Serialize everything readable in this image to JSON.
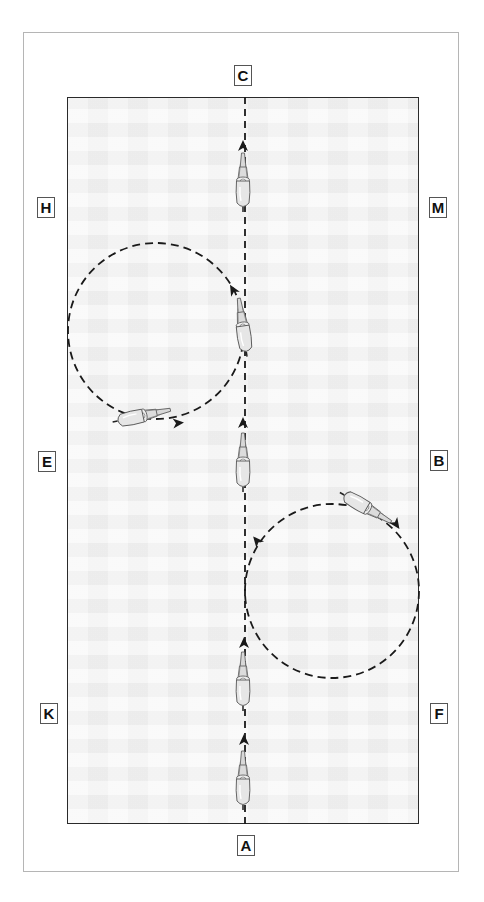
{
  "diagram": {
    "type": "dressage-arena-figure",
    "markers": [
      {
        "id": "C",
        "label": "C",
        "x": 234,
        "y": 65
      },
      {
        "id": "H",
        "label": "H",
        "x": 37,
        "y": 197
      },
      {
        "id": "M",
        "label": "M",
        "x": 429,
        "y": 197
      },
      {
        "id": "E",
        "label": "E",
        "x": 38,
        "y": 451
      },
      {
        "id": "B",
        "label": "B",
        "x": 430,
        "y": 450
      },
      {
        "id": "K",
        "label": "K",
        "x": 40,
        "y": 703
      },
      {
        "id": "F",
        "label": "F",
        "x": 430,
        "y": 703
      },
      {
        "id": "A",
        "label": "A",
        "x": 237,
        "y": 835
      }
    ],
    "paths": {
      "centerline": {
        "x": 245,
        "y1": 97,
        "y2": 824,
        "style": "dashed"
      },
      "left_circle": {
        "cx": 156,
        "cy": 331,
        "r": 88,
        "style": "dashed",
        "direction": "counter-clockwise"
      },
      "right_circle": {
        "cx": 332,
        "cy": 591,
        "r": 87,
        "style": "dashed",
        "direction": "clockwise"
      }
    },
    "arrows": [
      {
        "x": 243,
        "y": 146,
        "angle": 0
      },
      {
        "x": 233,
        "y": 290,
        "angle": -30
      },
      {
        "x": 178,
        "y": 423,
        "angle": 85
      },
      {
        "x": 243,
        "y": 423,
        "angle": 0
      },
      {
        "x": 396,
        "y": 524,
        "angle": 145
      },
      {
        "x": 257,
        "y": 541,
        "angle": -40
      },
      {
        "x": 244,
        "y": 643,
        "angle": 0
      },
      {
        "x": 244,
        "y": 740,
        "angle": 0
      }
    ],
    "horses": [
      {
        "x": 243,
        "y": 183,
        "angle": 0
      },
      {
        "x": 243,
        "y": 328,
        "angle": -8
      },
      {
        "x": 141,
        "y": 416,
        "angle": 78
      },
      {
        "x": 243,
        "y": 463,
        "angle": 0
      },
      {
        "x": 365,
        "y": 507,
        "angle": 120
      },
      {
        "x": 243,
        "y": 682,
        "angle": 0
      },
      {
        "x": 243,
        "y": 781,
        "angle": 0
      }
    ],
    "colors": {
      "arena_fill": "#f3f3f3",
      "arena_border": "#2a2a2a",
      "outer_border": "#b5b5b5",
      "path": "#1a1a1a",
      "horse_fill": "#e6e6e6",
      "horse_stroke": "#555555"
    }
  }
}
